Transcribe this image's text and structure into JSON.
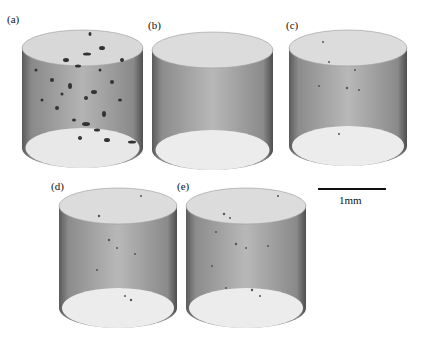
{
  "figure": {
    "panels": [
      {
        "id": "a",
        "label": "(a)",
        "x": 22,
        "y": 30,
        "w": 121,
        "h": 138,
        "lx": 7,
        "ly": 14,
        "pores": "many-large"
      },
      {
        "id": "b",
        "label": "(b)",
        "x": 152,
        "y": 32,
        "w": 121,
        "h": 138,
        "lx": 148,
        "ly": 20,
        "pores": "none"
      },
      {
        "id": "c",
        "label": "(c)",
        "x": 289,
        "y": 30,
        "w": 118,
        "h": 136,
        "lx": 286,
        "ly": 20,
        "pores": "few-small"
      },
      {
        "id": "d",
        "label": "(d)",
        "x": 59,
        "y": 188,
        "w": 118,
        "h": 140,
        "lx": 51,
        "ly": 181,
        "pores": "few-small"
      },
      {
        "id": "e",
        "label": "(e)",
        "x": 186,
        "y": 188,
        "w": 120,
        "h": 140,
        "lx": 177,
        "ly": 181,
        "pores": "some-small"
      }
    ],
    "scale_bar": {
      "label": "1mm",
      "length_px": 68
    }
  }
}
